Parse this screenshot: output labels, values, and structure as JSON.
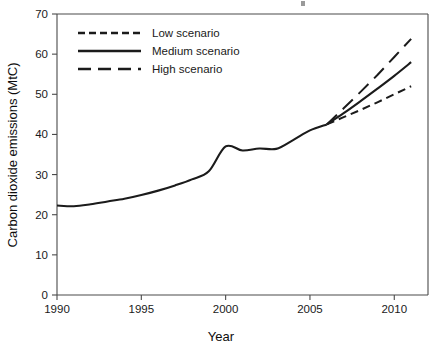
{
  "chart_data": {
    "type": "line",
    "title": "",
    "xlabel": "Year",
    "ylabel": "Carbon dioxide emissions (MtC)",
    "xlim": [
      1990,
      2012
    ],
    "ylim": [
      0,
      70
    ],
    "xticks": [
      1990,
      1995,
      2000,
      2005,
      2010
    ],
    "yticks": [
      0,
      10,
      20,
      30,
      40,
      50,
      60,
      70
    ],
    "grid": false,
    "legend_position": "top-left",
    "legend": [
      "Low scenario",
      "Medium scenario",
      "High scenario"
    ],
    "branch_year": 2006,
    "branch_value": 42.5,
    "series": [
      {
        "name": "Historical",
        "style": "solid",
        "x": [
          1990,
          1991,
          1992,
          1993,
          1994,
          1995,
          1996,
          1997,
          1998,
          1999,
          2000,
          2001,
          2002,
          2003,
          2004,
          2005,
          2006
        ],
        "values": [
          22.3,
          22.1,
          22.6,
          23.3,
          24.0,
          24.9,
          26.0,
          27.3,
          28.8,
          30.8,
          37.0,
          36.0,
          36.5,
          36.4,
          38.6,
          41.0,
          42.5
        ]
      },
      {
        "name": "Low scenario",
        "style": "short-dash",
        "x": [
          2006,
          2007,
          2008,
          2009,
          2010,
          2011
        ],
        "values": [
          42.5,
          44.3,
          46.1,
          48.0,
          50.0,
          52.0
        ]
      },
      {
        "name": "Medium scenario",
        "style": "solid",
        "x": [
          2006,
          2007,
          2008,
          2009,
          2010,
          2011
        ],
        "values": [
          42.5,
          45.3,
          48.3,
          51.4,
          54.6,
          58.0
        ]
      },
      {
        "name": "High scenario",
        "style": "long-dash",
        "x": [
          2006,
          2007,
          2008,
          2009,
          2010,
          2011
        ],
        "values": [
          42.5,
          46.5,
          50.6,
          54.8,
          59.3,
          63.8
        ]
      }
    ]
  }
}
